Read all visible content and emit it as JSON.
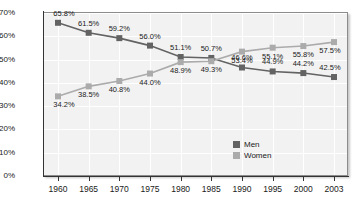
{
  "chart_data": {
    "type": "line",
    "title": "",
    "xlabel": "",
    "ylabel": "",
    "categories": [
      "1960",
      "1965",
      "1970",
      "1975",
      "1980",
      "1985",
      "1990",
      "1995",
      "2000",
      "2003"
    ],
    "series": [
      {
        "name": "Men",
        "color": "#636363",
        "values": [
          65.8,
          61.5,
          59.2,
          56.0,
          51.1,
          50.7,
          46.6,
          44.9,
          44.2,
          42.5
        ],
        "labels": [
          "65.8%",
          "61.5%",
          "59.2%",
          "56.0%",
          "51.1%",
          "50.7%",
          "46.6%",
          "44.9%",
          "44.2%",
          "42.5%"
        ]
      },
      {
        "name": "Women",
        "color": "#ababab",
        "values": [
          34.2,
          38.5,
          40.8,
          44.0,
          48.9,
          49.3,
          53.4,
          55.1,
          55.8,
          57.5
        ],
        "labels": [
          "34.2%",
          "38.5%",
          "40.8%",
          "44.0%",
          "48.9%",
          "49.3%",
          "53.4%",
          "55.1%",
          "55.8%",
          "57.5%"
        ]
      }
    ],
    "ylim": [
      0,
      70
    ],
    "yticks": [
      0,
      10,
      20,
      30,
      40,
      50,
      60,
      70
    ],
    "ytick_labels": [
      "0%",
      "10%",
      "20%",
      "30%",
      "40%",
      "50%",
      "60%",
      "70%"
    ],
    "grid": true,
    "legend_position": "inside-bottom-right"
  },
  "legend": {
    "entries": [
      {
        "label": "Men",
        "color": "#636363"
      },
      {
        "label": "Women",
        "color": "#ababab"
      }
    ]
  }
}
